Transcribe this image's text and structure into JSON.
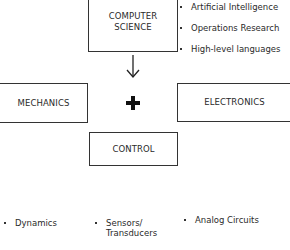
{
  "diagram": {
    "boxes": {
      "computer_science": {
        "line1": "COMPUTER",
        "line2": "SCIENCE"
      },
      "mechanics": {
        "label": "MECHANICS"
      },
      "electronics": {
        "label": "ELECTRONICS"
      },
      "control": {
        "label": "CONTROL"
      }
    },
    "connector_symbols": {
      "arrow": "down-arrow",
      "plus": "plus"
    },
    "computer_science_topics": [
      "Artificial Intelligence",
      "Operations Research",
      "High-level languages"
    ],
    "bottom_topics": [
      {
        "line1": "Dynamics"
      },
      {
        "line1": "Sensors/",
        "line2": "Transducers"
      },
      {
        "line1": "Analog Circuits"
      }
    ]
  }
}
